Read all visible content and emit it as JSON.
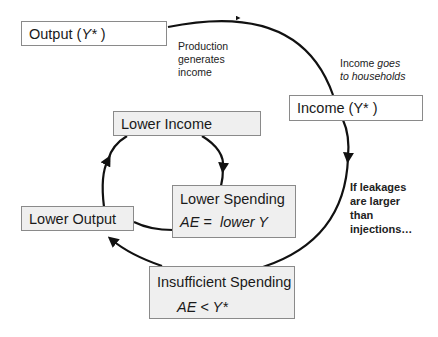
{
  "nodes": {
    "output": {
      "label": "Output (",
      "var": "Y*",
      "close": " )"
    },
    "income": {
      "label": "Income (",
      "var": "Y*",
      "close": " )"
    },
    "lower_income": {
      "label": "Lower Income"
    },
    "lower_spending": {
      "label": "Lower Spending",
      "eq_lhs": "AE =",
      "eq_rhs": "lower Y"
    },
    "lower_output": {
      "label": "Lower Output"
    },
    "insufficient_spending": {
      "label": "Insufficient Spending",
      "eq": "AE < Y*"
    }
  },
  "annotations": {
    "production": [
      "Production",
      "generates",
      "income"
    ],
    "income_goes": {
      "plain": "Income ",
      "italic1": "goes",
      "italic2": "to households"
    },
    "leakages": [
      "If leakages",
      "are larger",
      "than",
      "injections…"
    ]
  },
  "colors": {
    "box_border": "#8a8a8a",
    "box_grey_fill": "#efefef",
    "box_white_fill": "#ffffff",
    "arrow": "#111111"
  }
}
